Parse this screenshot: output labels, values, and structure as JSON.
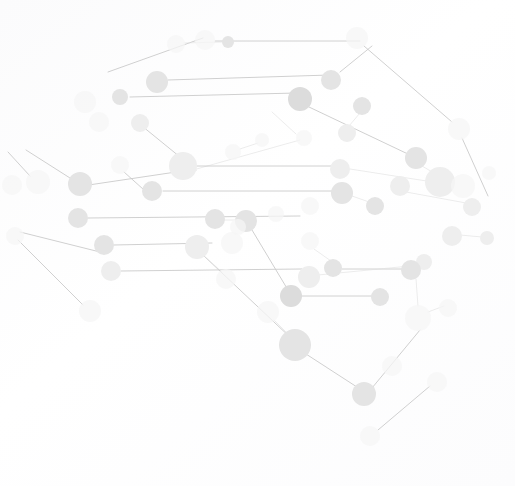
{
  "graphic": {
    "title": "Digital Brain Network",
    "subject": "brain-shaped node-and-edge network illustration",
    "width": 515,
    "height": 486,
    "background_color": "#fdfdfd",
    "palette": {
      "node_dark": "#dcdcdc",
      "node_medium": "#e4e4e4",
      "node_light": "#eeeeee",
      "node_faint": "#f5f5f6",
      "edge_dark": "#c8c8c8",
      "edge_light": "#e0e0e0"
    },
    "caption": "",
    "label_text": ""
  },
  "network": {
    "node_count": 62,
    "edge_count": 44,
    "nodes": [
      {
        "id": "n1",
        "cx": 205,
        "cy": 40,
        "r": 10,
        "tone": "faint"
      },
      {
        "id": "n2",
        "cx": 228,
        "cy": 42,
        "r": 6,
        "tone": "medium"
      },
      {
        "id": "n3",
        "cx": 357,
        "cy": 38,
        "r": 11,
        "tone": "faint"
      },
      {
        "id": "n4",
        "cx": 157,
        "cy": 82,
        "r": 11,
        "tone": "medium"
      },
      {
        "id": "n5",
        "cx": 120,
        "cy": 97,
        "r": 8,
        "tone": "medium"
      },
      {
        "id": "n6",
        "cx": 85,
        "cy": 102,
        "r": 11,
        "tone": "faint"
      },
      {
        "id": "n7",
        "cx": 99,
        "cy": 122,
        "r": 10,
        "tone": "faint"
      },
      {
        "id": "n8",
        "cx": 140,
        "cy": 123,
        "r": 9,
        "tone": "light"
      },
      {
        "id": "n9",
        "cx": 331,
        "cy": 80,
        "r": 10,
        "tone": "medium"
      },
      {
        "id": "n10",
        "cx": 300,
        "cy": 99,
        "r": 12,
        "tone": "dark"
      },
      {
        "id": "n11",
        "cx": 362,
        "cy": 106,
        "r": 9,
        "tone": "medium"
      },
      {
        "id": "n12",
        "cx": 347,
        "cy": 133,
        "r": 9,
        "tone": "light"
      },
      {
        "id": "n13",
        "cx": 304,
        "cy": 138,
        "r": 8,
        "tone": "faint"
      },
      {
        "id": "n14",
        "cx": 416,
        "cy": 158,
        "r": 11,
        "tone": "medium"
      },
      {
        "id": "n15",
        "cx": 440,
        "cy": 182,
        "r": 15,
        "tone": "light"
      },
      {
        "id": "n16",
        "cx": 400,
        "cy": 186,
        "r": 10,
        "tone": "light"
      },
      {
        "id": "n17",
        "cx": 459,
        "cy": 129,
        "r": 11,
        "tone": "faint"
      },
      {
        "id": "n18",
        "cx": 489,
        "cy": 173,
        "r": 7,
        "tone": "faint"
      },
      {
        "id": "n19",
        "cx": 472,
        "cy": 207,
        "r": 9,
        "tone": "light"
      },
      {
        "id": "n20",
        "cx": 183,
        "cy": 166,
        "r": 14,
        "tone": "light"
      },
      {
        "id": "n21",
        "cx": 152,
        "cy": 191,
        "r": 10,
        "tone": "medium"
      },
      {
        "id": "n22",
        "cx": 80,
        "cy": 184,
        "r": 12,
        "tone": "medium"
      },
      {
        "id": "n23",
        "cx": 38,
        "cy": 182,
        "r": 12,
        "tone": "faint"
      },
      {
        "id": "n24",
        "cx": 12,
        "cy": 185,
        "r": 10,
        "tone": "faint"
      },
      {
        "id": "n25",
        "cx": 78,
        "cy": 218,
        "r": 10,
        "tone": "medium"
      },
      {
        "id": "n26",
        "cx": 340,
        "cy": 169,
        "r": 10,
        "tone": "light"
      },
      {
        "id": "n27",
        "cx": 342,
        "cy": 193,
        "r": 11,
        "tone": "medium"
      },
      {
        "id": "n28",
        "cx": 375,
        "cy": 206,
        "r": 9,
        "tone": "medium"
      },
      {
        "id": "n29",
        "cx": 215,
        "cy": 219,
        "r": 10,
        "tone": "medium"
      },
      {
        "id": "n30",
        "cx": 246,
        "cy": 221,
        "r": 11,
        "tone": "medium"
      },
      {
        "id": "n31",
        "cx": 232,
        "cy": 243,
        "r": 11,
        "tone": "faint"
      },
      {
        "id": "n32",
        "cx": 197,
        "cy": 247,
        "r": 12,
        "tone": "light"
      },
      {
        "id": "n33",
        "cx": 104,
        "cy": 245,
        "r": 10,
        "tone": "medium"
      },
      {
        "id": "n34",
        "cx": 111,
        "cy": 271,
        "r": 10,
        "tone": "light"
      },
      {
        "id": "n35",
        "cx": 15,
        "cy": 236,
        "r": 9,
        "tone": "faint"
      },
      {
        "id": "n36",
        "cx": 90,
        "cy": 311,
        "r": 11,
        "tone": "faint"
      },
      {
        "id": "n37",
        "cx": 310,
        "cy": 241,
        "r": 9,
        "tone": "faint"
      },
      {
        "id": "n38",
        "cx": 452,
        "cy": 236,
        "r": 10,
        "tone": "light"
      },
      {
        "id": "n39",
        "cx": 487,
        "cy": 238,
        "r": 7,
        "tone": "light"
      },
      {
        "id": "n40",
        "cx": 424,
        "cy": 262,
        "r": 8,
        "tone": "light"
      },
      {
        "id": "n41",
        "cx": 309,
        "cy": 277,
        "r": 11,
        "tone": "light"
      },
      {
        "id": "n42",
        "cx": 333,
        "cy": 268,
        "r": 9,
        "tone": "medium"
      },
      {
        "id": "n43",
        "cx": 411,
        "cy": 270,
        "r": 10,
        "tone": "medium"
      },
      {
        "id": "n44",
        "cx": 291,
        "cy": 296,
        "r": 11,
        "tone": "dark"
      },
      {
        "id": "n45",
        "cx": 380,
        "cy": 297,
        "r": 9,
        "tone": "medium"
      },
      {
        "id": "n46",
        "cx": 268,
        "cy": 312,
        "r": 11,
        "tone": "faint"
      },
      {
        "id": "n47",
        "cx": 418,
        "cy": 318,
        "r": 13,
        "tone": "faint"
      },
      {
        "id": "n48",
        "cx": 448,
        "cy": 308,
        "r": 9,
        "tone": "faint"
      },
      {
        "id": "n49",
        "cx": 295,
        "cy": 345,
        "r": 16,
        "tone": "medium"
      },
      {
        "id": "n50",
        "cx": 364,
        "cy": 394,
        "r": 12,
        "tone": "medium"
      },
      {
        "id": "n51",
        "cx": 392,
        "cy": 366,
        "r": 10,
        "tone": "faint"
      },
      {
        "id": "n52",
        "cx": 437,
        "cy": 382,
        "r": 10,
        "tone": "faint"
      },
      {
        "id": "n53",
        "cx": 370,
        "cy": 436,
        "r": 10,
        "tone": "faint"
      },
      {
        "id": "n54",
        "cx": 226,
        "cy": 279,
        "r": 10,
        "tone": "faint"
      },
      {
        "id": "n55",
        "cx": 238,
        "cy": 227,
        "r": 8,
        "tone": "faint"
      },
      {
        "id": "n56",
        "cx": 463,
        "cy": 186,
        "r": 12,
        "tone": "faint"
      },
      {
        "id": "n57",
        "cx": 276,
        "cy": 214,
        "r": 8,
        "tone": "faint"
      },
      {
        "id": "n58",
        "cx": 120,
        "cy": 165,
        "r": 9,
        "tone": "faint"
      },
      {
        "id": "n59",
        "cx": 233,
        "cy": 152,
        "r": 8,
        "tone": "faint"
      },
      {
        "id": "n60",
        "cx": 310,
        "cy": 206,
        "r": 9,
        "tone": "faint"
      },
      {
        "id": "n61",
        "cx": 176,
        "cy": 44,
        "r": 9,
        "tone": "faint"
      },
      {
        "id": "n62",
        "cx": 262,
        "cy": 140,
        "r": 7,
        "tone": "faint"
      }
    ],
    "edges": [
      {
        "from": "n1",
        "to": "n9",
        "x1": 215,
        "y1": 41,
        "x2": 360,
        "y2": 41,
        "tone": "dark"
      },
      {
        "from": "n4",
        "to": "n9",
        "x1": 168,
        "y1": 80,
        "x2": 330,
        "y2": 75,
        "tone": "dark"
      },
      {
        "from": "n5",
        "to": "n10",
        "x1": 130,
        "y1": 97,
        "x2": 297,
        "y2": 93,
        "tone": "dark"
      },
      {
        "from": "n61",
        "to": "n4",
        "x1": 108,
        "y1": 72,
        "x2": 203,
        "y2": 38,
        "tone": "dark"
      },
      {
        "from": "n8",
        "to": "n20",
        "x1": 142,
        "y1": 126,
        "x2": 196,
        "y2": 170,
        "tone": "dark"
      },
      {
        "from": "n20",
        "to": "n22",
        "x1": 176,
        "y1": 172,
        "x2": 82,
        "y2": 186,
        "tone": "dark"
      },
      {
        "from": "n22",
        "to": "n23",
        "x1": 70,
        "y1": 178,
        "x2": 26,
        "y2": 150,
        "tone": "dark"
      },
      {
        "from": "n23",
        "to": "n24",
        "x1": 30,
        "y1": 176,
        "x2": 8,
        "y2": 152,
        "tone": "dark"
      },
      {
        "from": "n58",
        "to": "n21",
        "x1": 124,
        "y1": 172,
        "x2": 153,
        "y2": 198,
        "tone": "dark"
      },
      {
        "from": "n59",
        "to": "n20",
        "x1": 193,
        "y1": 170,
        "x2": 300,
        "y2": 140,
        "tone": "light"
      },
      {
        "from": "n20",
        "to": "n26",
        "x1": 195,
        "y1": 166,
        "x2": 338,
        "y2": 166,
        "tone": "dark"
      },
      {
        "from": "n21",
        "to": "n27",
        "x1": 163,
        "y1": 191,
        "x2": 340,
        "y2": 191,
        "tone": "dark"
      },
      {
        "from": "n25",
        "to": "n57",
        "x1": 88,
        "y1": 218,
        "x2": 300,
        "y2": 216,
        "tone": "dark"
      },
      {
        "from": "n33",
        "to": "n29",
        "x1": 114,
        "y1": 245,
        "x2": 212,
        "y2": 243,
        "tone": "dark"
      },
      {
        "from": "n34",
        "to": "n41",
        "x1": 121,
        "y1": 271,
        "x2": 302,
        "y2": 269,
        "tone": "dark"
      },
      {
        "from": "n35",
        "to": "n33",
        "x1": 20,
        "y1": 232,
        "x2": 100,
        "y2": 252,
        "tone": "dark"
      },
      {
        "from": "n36",
        "to": "n34",
        "x1": 83,
        "y1": 305,
        "x2": 18,
        "y2": 240,
        "tone": "dark"
      },
      {
        "from": "n30",
        "to": "n44",
        "x1": 252,
        "y1": 230,
        "x2": 288,
        "y2": 290,
        "tone": "dark"
      },
      {
        "from": "n32",
        "to": "n49",
        "x1": 204,
        "y1": 256,
        "x2": 292,
        "y2": 339,
        "tone": "dark"
      },
      {
        "from": "n44",
        "to": "n45",
        "x1": 301,
        "y1": 296,
        "x2": 378,
        "y2": 296,
        "tone": "dark"
      },
      {
        "from": "n42",
        "to": "n43",
        "x1": 342,
        "y1": 269,
        "x2": 408,
        "y2": 269,
        "tone": "dark"
      },
      {
        "from": "n41",
        "to": "n40",
        "x1": 318,
        "y1": 275,
        "x2": 420,
        "y2": 265,
        "tone": "light"
      },
      {
        "from": "n49",
        "to": "n50",
        "x1": 306,
        "y1": 354,
        "x2": 360,
        "y2": 389,
        "tone": "dark"
      },
      {
        "from": "n50",
        "to": "n47",
        "x1": 372,
        "y1": 388,
        "x2": 420,
        "y2": 330,
        "tone": "dark"
      },
      {
        "from": "n53",
        "to": "n52",
        "x1": 378,
        "y1": 430,
        "x2": 430,
        "y2": 386,
        "tone": "dark"
      },
      {
        "from": "n9",
        "to": "n3",
        "x1": 340,
        "y1": 72,
        "x2": 372,
        "y2": 46,
        "tone": "dark"
      },
      {
        "from": "n3",
        "to": "n17",
        "x1": 364,
        "y1": 46,
        "x2": 452,
        "y2": 122,
        "tone": "dark"
      },
      {
        "from": "n17",
        "to": "n18",
        "x1": 462,
        "y1": 138,
        "x2": 488,
        "y2": 196,
        "tone": "dark"
      },
      {
        "from": "n10",
        "to": "n14",
        "x1": 309,
        "y1": 107,
        "x2": 410,
        "y2": 155,
        "tone": "dark"
      },
      {
        "from": "n11",
        "to": "n12",
        "x1": 360,
        "y1": 113,
        "x2": 349,
        "y2": 126,
        "tone": "light"
      },
      {
        "from": "n13",
        "to": "n10",
        "x1": 296,
        "y1": 134,
        "x2": 272,
        "y2": 112,
        "tone": "light"
      },
      {
        "from": "n26",
        "to": "n56",
        "x1": 350,
        "y1": 169,
        "x2": 452,
        "y2": 185,
        "tone": "light"
      },
      {
        "from": "n27",
        "to": "n28",
        "x1": 352,
        "y1": 196,
        "x2": 372,
        "y2": 203,
        "tone": "light"
      },
      {
        "from": "n29",
        "to": "n30",
        "x1": 224,
        "y1": 220,
        "x2": 236,
        "y2": 220,
        "tone": "light"
      },
      {
        "from": "n38",
        "to": "n39",
        "x1": 460,
        "y1": 235,
        "x2": 482,
        "y2": 237,
        "tone": "light"
      },
      {
        "from": "n43",
        "to": "n47",
        "x1": 416,
        "y1": 279,
        "x2": 418,
        "y2": 306,
        "tone": "light"
      },
      {
        "from": "n46",
        "to": "n49",
        "x1": 274,
        "y1": 320,
        "x2": 290,
        "y2": 336,
        "tone": "light"
      },
      {
        "from": "n47",
        "to": "n48",
        "x1": 428,
        "y1": 312,
        "x2": 444,
        "y2": 306,
        "tone": "light"
      },
      {
        "from": "n37",
        "to": "n42",
        "x1": 314,
        "y1": 249,
        "x2": 331,
        "y2": 261,
        "tone": "light"
      },
      {
        "from": "n16",
        "to": "n19",
        "x1": 406,
        "y1": 192,
        "x2": 466,
        "y2": 203,
        "tone": "light"
      },
      {
        "from": "n14",
        "to": "n15",
        "x1": 422,
        "y1": 166,
        "x2": 434,
        "y2": 173,
        "tone": "light"
      },
      {
        "from": "n2",
        "to": "n61",
        "x1": 222,
        "y1": 42,
        "x2": 184,
        "y2": 43,
        "tone": "light"
      },
      {
        "from": "n54",
        "to": "n32",
        "x1": 222,
        "y1": 272,
        "x2": 203,
        "y2": 255,
        "tone": "light"
      },
      {
        "from": "n62",
        "to": "n59",
        "x1": 258,
        "y1": 143,
        "x2": 240,
        "y2": 149,
        "tone": "light"
      }
    ]
  }
}
